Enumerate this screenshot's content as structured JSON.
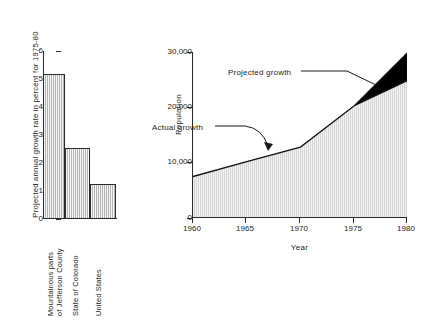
{
  "chart_data": [
    {
      "type": "bar",
      "id": "growth-rate-bar-chart",
      "title": "",
      "xlabel": "",
      "ylabel": "Projected annual growth rate in percent for 1975-80",
      "categories": [
        "Mountainous parts of Jefferson County",
        "State of Colorado",
        "United States"
      ],
      "category_lines": [
        [
          "Mountainous parts",
          "of Jefferson County"
        ],
        [
          "State of Colorado"
        ],
        [
          "United States"
        ]
      ],
      "values": [
        5.45,
        2.65,
        1.3
      ],
      "ylim": [
        0,
        6.3
      ],
      "yticks": [
        0,
        1,
        2,
        3,
        4,
        5,
        6
      ],
      "ytick_labels": [
        "0",
        "1",
        "2",
        "3",
        "4",
        "5",
        "6"
      ],
      "grid": false,
      "legend": "none",
      "fill_color": "#d4d4d4",
      "edge_color": "#2b2b2b"
    },
    {
      "type": "area",
      "id": "population-growth-area-chart",
      "title": "",
      "xlabel": "Year",
      "ylabel": "Population",
      "x": [
        1960,
        1965,
        1970,
        1975,
        1980
      ],
      "xlim": [
        1960,
        1980
      ],
      "xticks": [
        1960,
        1965,
        1970,
        1975,
        1980
      ],
      "xtick_labels": [
        "1960",
        "1965",
        "1970",
        "1975",
        "1980"
      ],
      "ylim": [
        0,
        30000
      ],
      "yticks": [
        0,
        10000,
        20000,
        30000
      ],
      "ytick_labels": [
        "0",
        "10,000",
        "20,000",
        "30,000"
      ],
      "grid": false,
      "legend": "annotations",
      "series": [
        {
          "name": "Actual growth",
          "fill_color": "#d4d4d4",
          "values": [
            7500,
            10200,
            12800,
            20300,
            25000
          ]
        },
        {
          "name": "Projected growth",
          "fill_color": "#000000",
          "values": [
            7500,
            10200,
            12800,
            20300,
            30000
          ]
        }
      ],
      "annotations": [
        {
          "text": "Projected growth",
          "x": 1973.2,
          "y": 25500
        },
        {
          "text": "Actual growth",
          "x": 1962.4,
          "y": 15200
        }
      ]
    }
  ]
}
